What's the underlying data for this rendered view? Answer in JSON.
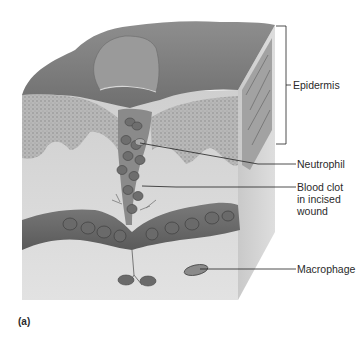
{
  "figure": {
    "panel_label": "(a)",
    "labels": {
      "epidermis": "Epidermis",
      "neutrophil": "Neutrophil",
      "blood_clot_line1": "Blood clot",
      "blood_clot_line2": "in incised",
      "blood_clot_line3": "wound",
      "macrophage": "Macrophage"
    }
  }
}
